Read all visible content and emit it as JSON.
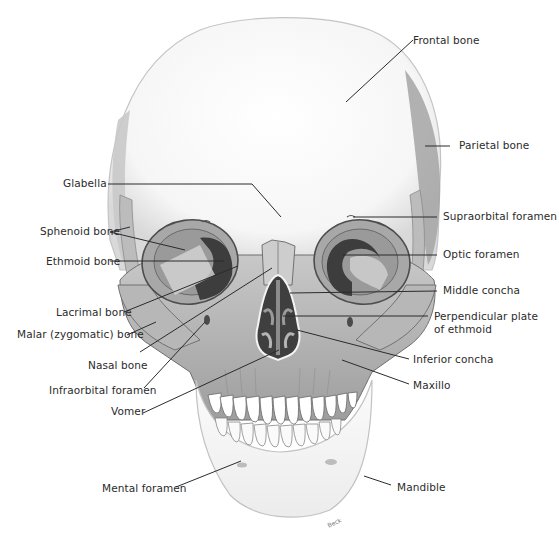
{
  "diagram": {
    "signature": "Beck",
    "colors": {
      "bone_light": "#f7f7f7",
      "bone_shade": "#bdbdbd",
      "bone_mid": "#a9a9a9",
      "bone_dark": "#5e5e5e",
      "cavity": "#3a3a3a",
      "leader_line": "#2b2b2b",
      "label_text": "#2b2b2b",
      "background": "#ffffff"
    },
    "labels": [
      {
        "id": "frontal-bone",
        "text": "Frontal bone",
        "side": "right",
        "x": 413,
        "y": 34,
        "line": [
          [
            413,
            40
          ],
          [
            346,
            102
          ]
        ]
      },
      {
        "id": "parietal-bone",
        "text": "Parietal bone",
        "side": "right",
        "x": 459,
        "y": 139,
        "line": [
          [
            450,
            146
          ],
          [
            425,
            146
          ]
        ]
      },
      {
        "id": "glabella",
        "text": "Glabella",
        "side": "left",
        "x": 63,
        "y": 177,
        "line": [
          [
            108,
            184
          ],
          [
            252,
            184
          ],
          [
            281,
            217
          ]
        ]
      },
      {
        "id": "suproorbital-foramen",
        "text": "Supraorbital foramen",
        "side": "right",
        "x": 443,
        "y": 210,
        "line": [
          [
            437,
            217
          ],
          [
            353,
            217
          ]
        ]
      },
      {
        "id": "sphenoid-bone",
        "text": "Sphenoid bone",
        "side": "left",
        "x": 40,
        "y": 225,
        "line": [
          [
            110,
            232
          ],
          [
            130,
            227
          ]
        ],
        "line2": [
          [
            110,
            232
          ],
          [
            185,
            250
          ]
        ]
      },
      {
        "id": "optic-foramen",
        "text": "Optic foramen",
        "side": "right",
        "x": 443,
        "y": 248,
        "line": [
          [
            437,
            255
          ],
          [
            343,
            255
          ]
        ]
      },
      {
        "id": "ethmoid-bone",
        "text": "Ethmoid bone",
        "side": "left",
        "x": 46,
        "y": 255,
        "line": [
          [
            110,
            261
          ],
          [
            224,
            261
          ]
        ]
      },
      {
        "id": "middle-concha",
        "text": "Middle concha",
        "side": "right",
        "x": 443,
        "y": 284,
        "line": [
          [
            437,
            291
          ],
          [
            290,
            293
          ]
        ]
      },
      {
        "id": "lacrimal-bone",
        "text": "Lacrimal bone",
        "side": "left",
        "x": 56,
        "y": 306,
        "line": [
          [
            124,
            312
          ],
          [
            238,
            266
          ]
        ]
      },
      {
        "id": "perpendicular-plate",
        "text": "Perpendicular plate",
        "text2": "of ethmoid",
        "side": "right",
        "x": 434,
        "y": 310,
        "line": [
          [
            428,
            316
          ],
          [
            283,
            316
          ]
        ]
      },
      {
        "id": "malar-bone",
        "text": "Malar (zygomatic) bone",
        "side": "left",
        "x": 17,
        "y": 328,
        "line": [
          [
            127,
            335
          ],
          [
            156,
            322
          ]
        ]
      },
      {
        "id": "nasal-bone",
        "text": "Nasal bone",
        "side": "left",
        "x": 88,
        "y": 359,
        "line": [
          [
            140,
            352
          ],
          [
            272,
            268
          ]
        ]
      },
      {
        "id": "inferior-concha",
        "text": "Inferior concha",
        "side": "right",
        "x": 413,
        "y": 353,
        "line": [
          [
            409,
            359
          ],
          [
            297,
            330
          ]
        ]
      },
      {
        "id": "infraorbital-foramen",
        "text": "Infraorbital foramen",
        "side": "left",
        "x": 49,
        "y": 384,
        "line": [
          [
            144,
            388
          ],
          [
            205,
            322
          ]
        ]
      },
      {
        "id": "maxilla",
        "text": "Maxillo",
        "side": "right",
        "x": 413,
        "y": 379,
        "line": [
          [
            409,
            384
          ],
          [
            342,
            360
          ]
        ]
      },
      {
        "id": "vomer",
        "text": "Vomer",
        "side": "left",
        "x": 111,
        "y": 405,
        "line": [
          [
            143,
            413
          ],
          [
            279,
            350
          ]
        ]
      },
      {
        "id": "mental-foramen",
        "text": "Mental foramen",
        "side": "left",
        "x": 102,
        "y": 482,
        "line": [
          [
            176,
            487
          ],
          [
            241,
            461
          ]
        ]
      },
      {
        "id": "mandible",
        "text": "Mandible",
        "side": "right",
        "x": 397,
        "y": 481,
        "line": [
          [
            391,
            485
          ],
          [
            364,
            476
          ]
        ]
      }
    ]
  }
}
